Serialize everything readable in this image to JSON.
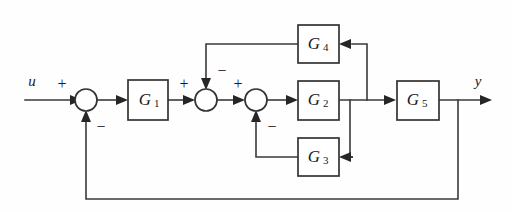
{
  "diagram": {
    "type": "block-diagram",
    "background_color": "#fefefe",
    "line_color": "#3a3a3a",
    "box_fill": "#ffffff",
    "box_stroke": "#333333",
    "inputs": [
      {
        "name": "u",
        "label": "u"
      }
    ],
    "outputs": [
      {
        "name": "y",
        "label": "y"
      }
    ],
    "blocks": [
      {
        "id": "G1",
        "label": "G",
        "subscript": "1",
        "x": 128,
        "y": 80,
        "w": 40,
        "h": 40
      },
      {
        "id": "G2",
        "label": "G",
        "subscript": "2",
        "x": 298,
        "y": 81,
        "w": 41,
        "h": 39
      },
      {
        "id": "G3",
        "label": "G",
        "subscript": "3",
        "x": 298,
        "y": 138,
        "w": 41,
        "h": 38
      },
      {
        "id": "G4",
        "label": "G",
        "subscript": "4",
        "x": 298,
        "y": 25,
        "w": 41,
        "h": 38
      },
      {
        "id": "G5",
        "label": "G",
        "subscript": "5",
        "x": 397,
        "y": 81,
        "w": 42,
        "h": 39
      }
    ],
    "summing_junctions": [
      {
        "id": "S1",
        "cx": 86,
        "cy": 100,
        "r": 11,
        "signs": [
          {
            "sign": "+",
            "position": "input-left",
            "x": 62,
            "y": 85
          },
          {
            "sign": "−",
            "position": "input-bottom",
            "x": 101,
            "y": 128
          }
        ]
      },
      {
        "id": "S2",
        "cx": 206,
        "cy": 100,
        "r": 11,
        "signs": [
          {
            "sign": "+",
            "position": "input-left",
            "x": 184,
            "y": 85
          },
          {
            "sign": "−",
            "position": "input-top",
            "x": 222,
            "y": 72
          }
        ]
      },
      {
        "id": "S3",
        "cx": 256,
        "cy": 100,
        "r": 11,
        "signs": [
          {
            "sign": "+",
            "position": "input-left",
            "x": 238,
            "y": 85
          },
          {
            "sign": "−",
            "position": "input-bottom",
            "x": 272,
            "y": 128
          }
        ]
      }
    ],
    "feedback_paths": [
      {
        "id": "fb-G3",
        "from": "G2-output",
        "through": "G3",
        "to": "S3",
        "sign": "−"
      },
      {
        "id": "fb-G4",
        "from": "G2-G5-link",
        "through": "G4",
        "to": "S2",
        "sign": "−"
      },
      {
        "id": "fb-outer",
        "from": "y-output",
        "through": "direct",
        "to": "S1",
        "sign": "−"
      }
    ]
  }
}
